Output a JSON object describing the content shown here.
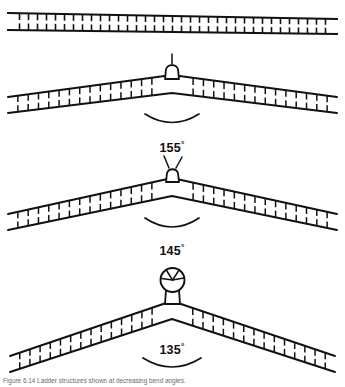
{
  "figure": {
    "background_color": "#ffffff",
    "ink_color": "#111111",
    "panels": [
      {
        "id": "panel-straight",
        "name": "straight-ladder",
        "angle_label": "",
        "angle_degrees": 180,
        "apex_terminal": "none",
        "rung_count": 34,
        "has_angle_arc": false
      },
      {
        "id": "panel-155",
        "name": "bent-ladder-155",
        "angle_label": "155",
        "degree_symbol": "°",
        "angle_degrees": 155,
        "apex_terminal": "dome-with-stem",
        "rung_count": 30,
        "has_angle_arc": true
      },
      {
        "id": "panel-145",
        "name": "bent-ladder-145",
        "angle_label": "145",
        "degree_symbol": "°",
        "angle_degrees": 145,
        "apex_terminal": "dome-with-two-antennae",
        "rung_count": 30,
        "has_angle_arc": true
      },
      {
        "id": "panel-135",
        "name": "bent-ladder-135",
        "angle_label": "135",
        "degree_symbol": "°",
        "angle_degrees": 135,
        "apex_terminal": "circular-head-with-spokes",
        "rung_count": 30,
        "has_angle_arc": true
      }
    ],
    "caption": "Figure 6.14  Ladder structures shown at decreasing bend angles."
  }
}
